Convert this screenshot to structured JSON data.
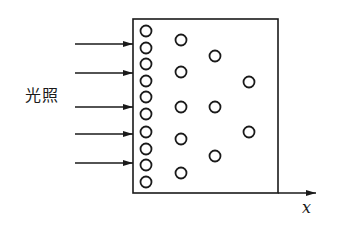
{
  "diagram": {
    "light_label": "光照",
    "axis_label": "x",
    "colors": {
      "stroke": "#1a1a1a",
      "background": "#ffffff"
    },
    "box": {
      "x": 133,
      "y": 19,
      "width": 145,
      "height": 174
    },
    "axis": {
      "from_x": 278,
      "to_x": 316,
      "y": 193
    },
    "arrows": [
      {
        "x1": 75,
        "x2": 133,
        "y": 44
      },
      {
        "x1": 75,
        "x2": 133,
        "y": 73
      },
      {
        "x1": 75,
        "x2": 133,
        "y": 107
      },
      {
        "x1": 75,
        "x2": 133,
        "y": 134
      },
      {
        "x1": 75,
        "x2": 133,
        "y": 163
      }
    ],
    "particle_radius": 5.5,
    "particles": [
      {
        "x": 146,
        "y": 31
      },
      {
        "x": 146,
        "y": 48
      },
      {
        "x": 146,
        "y": 64
      },
      {
        "x": 146,
        "y": 81
      },
      {
        "x": 146,
        "y": 97
      },
      {
        "x": 146,
        "y": 114
      },
      {
        "x": 146,
        "y": 132
      },
      {
        "x": 146,
        "y": 149
      },
      {
        "x": 146,
        "y": 165
      },
      {
        "x": 146,
        "y": 182
      },
      {
        "x": 181,
        "y": 40
      },
      {
        "x": 181,
        "y": 72
      },
      {
        "x": 181,
        "y": 107
      },
      {
        "x": 181,
        "y": 139
      },
      {
        "x": 181,
        "y": 173
      },
      {
        "x": 215,
        "y": 56
      },
      {
        "x": 215,
        "y": 107
      },
      {
        "x": 215,
        "y": 156
      },
      {
        "x": 249,
        "y": 82
      },
      {
        "x": 249,
        "y": 132
      }
    ]
  }
}
